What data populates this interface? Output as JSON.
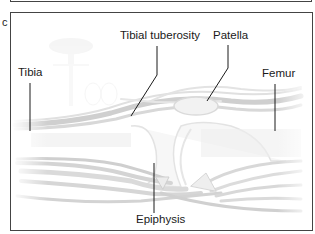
{
  "panel": {
    "letter": "c"
  },
  "labels": {
    "tibia": "Tibia",
    "tibial_tuberosity": "Tibial tuberosity",
    "patella": "Patella",
    "femur": "Femur",
    "epiphysis": "Epiphysis"
  }
}
